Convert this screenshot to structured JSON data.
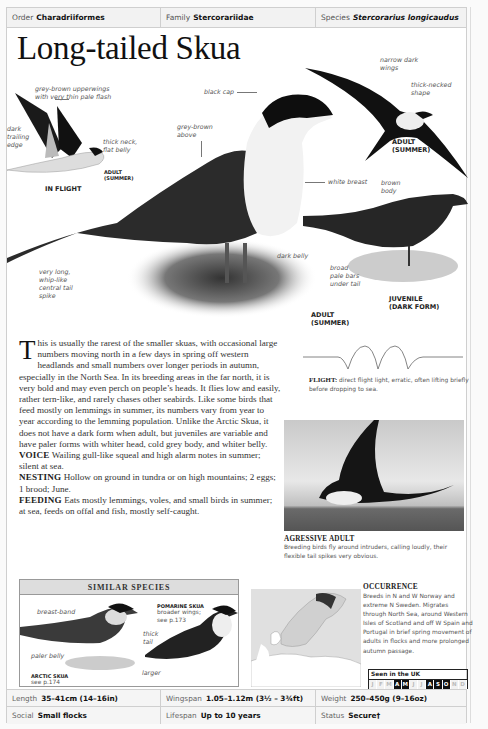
{
  "header": {
    "order": {
      "label": "Order",
      "value": "Charadriiformes"
    },
    "family": {
      "label": "Family",
      "value": "Stercorariidae"
    },
    "species": {
      "label": "Species",
      "value": "Stercorarius longicaudus"
    }
  },
  "title": "Long-tailed Skua",
  "illustrations": {
    "in_flight": {
      "caption": "IN FLIGHT",
      "sub_caption": [
        "ADULT",
        "(SUMMER)"
      ],
      "labels": {
        "upperwings": [
          "grey-brown upperwings",
          "with very thin pale flash"
        ],
        "trailing_edge": [
          "dark",
          "trailing",
          "edge"
        ],
        "neck": [
          "thick neck,",
          "flat belly"
        ]
      }
    },
    "main_adult": {
      "caption": [
        "ADULT",
        "(SUMMER)"
      ],
      "labels": {
        "black_cap": "black cap",
        "grey_brown": [
          "grey-brown",
          "above"
        ],
        "white_breast": "white breast",
        "dark_belly": "dark belly",
        "tail": [
          "very long,",
          "whip-like",
          "central tail",
          "spike"
        ]
      }
    },
    "flying_adult": {
      "caption": [
        "ADULT",
        "(SUMMER)"
      ],
      "labels": {
        "wings": [
          "narrow dark",
          "wings"
        ],
        "neck": [
          "thick-necked",
          "shape"
        ]
      }
    },
    "juvenile": {
      "caption": [
        "JUVENILE",
        "(DARK FORM)"
      ],
      "labels": {
        "body": [
          "brown",
          "body"
        ],
        "bars": [
          "broad",
          "pale bars",
          "under tail"
        ]
      }
    }
  },
  "flight": {
    "label": "FLIGHT:",
    "text": "direct flight light, erratic, often lifting briefly before dropping to sea."
  },
  "description": {
    "dropcap": "T",
    "intro": "his is usually the rarest of the smaller skuas, with occasional large numbers moving north in a few days in spring off western headlands and small numbers over longer periods in autumn, especially in the North Sea. In its breeding areas in the far north, it is very bold and may even perch on people’s heads. It flies low and easily, rather tern-like, and rarely chases other seabirds. Like some birds that feed mostly on lemmings in summer, its numbers vary from year to year according to the lemming population. Unlike the Arctic Skua, it does not have a dark form when adult, but juveniles are variable and have paler forms with whiter head, cold grey body, and whiter belly.",
    "voice": {
      "label": "VOICE",
      "text": "Wailing gull-like squeal and high alarm notes in summer; silent at sea."
    },
    "nesting": {
      "label": "NESTING",
      "text": "Hollow on ground in tundra or on high mountains; 2 eggs; 1 brood; June."
    },
    "feeding": {
      "label": "FEEDING",
      "text": "Eats mostly lemmings, voles, and small birds in summer; at sea, feeds on offal and fish, mostly self-caught."
    }
  },
  "photo": {
    "title": "AGRESSIVE ADULT",
    "caption": "Breeding birds fly around intruders, calling loudly, their flexible tail spikes very obvious."
  },
  "similar_species": {
    "heading": "SIMILAR SPECIES",
    "arctic": {
      "name": "ARCTIC SKUA",
      "ref": "see p.174",
      "labels": {
        "breast": "breast-band",
        "belly": "paler belly"
      }
    },
    "pomarine": {
      "name": "POMARINE SKUA",
      "note": [
        "broader wings;",
        "see p.173"
      ],
      "labels": {
        "tail": [
          "thick",
          "tail"
        ],
        "larger": "larger"
      }
    }
  },
  "occurrence": {
    "title": "OCCURRENCE",
    "text": "Breeds in N and W Norway and extreme N Sweden. Migrates through North Sea, around Western Isles of Scotland and off W Spain and Portugal in brief spring movement of adults in flocks and more prolonged autumn passage.",
    "seen_label": "Seen in the UK",
    "months": [
      {
        "m": "J",
        "on": false
      },
      {
        "m": "F",
        "on": false
      },
      {
        "m": "M",
        "on": false
      },
      {
        "m": "A",
        "on": true
      },
      {
        "m": "M",
        "on": true
      },
      {
        "m": "J",
        "on": false
      },
      {
        "m": "J",
        "on": false
      },
      {
        "m": "A",
        "on": true
      },
      {
        "m": "S",
        "on": true
      },
      {
        "m": "O",
        "on": true
      },
      {
        "m": "N",
        "on": false
      },
      {
        "m": "D",
        "on": false
      }
    ]
  },
  "stats": {
    "length": {
      "label": "Length",
      "value": "35–41cm (14–16in)"
    },
    "wingspan": {
      "label": "Wingspan",
      "value": "1.05–1.12m (3½ – 3¾ft)"
    },
    "weight": {
      "label": "Weight",
      "value": "250–450g (9–16oz)"
    },
    "social": {
      "label": "Social",
      "value": "Small flocks"
    },
    "lifespan": {
      "label": "Lifespan",
      "value": "Up to 10 years"
    },
    "status": {
      "label": "Status",
      "value": "Secure†"
    }
  }
}
